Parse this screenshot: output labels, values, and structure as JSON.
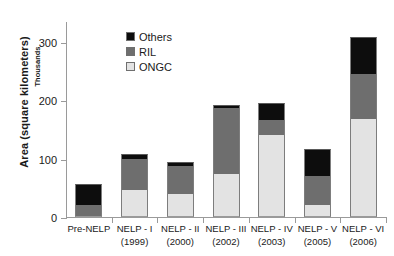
{
  "chart_data": {
    "type": "bar",
    "stacked": true,
    "title": "",
    "subtitle": "",
    "xlabel": "",
    "ylabel": "Area (square kilometers)",
    "y_secondary_label": "Thousands",
    "categories": [
      "Pre-NELP",
      "NELP - I",
      "NELP - II",
      "NELP - III",
      "NELP - IV",
      "NELP - V",
      "NELP - VI"
    ],
    "category_sublabels": [
      "",
      "(1999)",
      "(2000)",
      "(2002)",
      "(2003)",
      "(2005)",
      "(2006)"
    ],
    "series": [
      {
        "name": "ONGC",
        "color": "#e3e3e3",
        "values": [
          0,
          47,
          39,
          74,
          140,
          21,
          168
        ]
      },
      {
        "name": "RIL",
        "color": "#6e6e6e",
        "values": [
          21,
          52,
          49,
          113,
          27,
          50,
          77
        ]
      },
      {
        "name": "Others",
        "color": "#0d0d0d",
        "values": [
          36,
          9,
          7,
          5,
          28,
          46,
          63
        ]
      }
    ],
    "stack_order_bottom_to_top": [
      "ONGC",
      "RIL",
      "Others"
    ],
    "totals": [
      57,
      108,
      95,
      192,
      195,
      117,
      308
    ],
    "ylim": [
      0,
      336
    ],
    "yticks": [
      0,
      100,
      200,
      300
    ],
    "ytick_labels": [
      "0",
      "100",
      "200",
      "300"
    ],
    "grid": false,
    "legend_position": "inside-top-left",
    "legend": [
      {
        "label": "Others",
        "color": "#0d0d0d"
      },
      {
        "label": "RIL",
        "color": "#6e6e6e"
      },
      {
        "label": "ONGC",
        "color": "#e3e3e3"
      }
    ]
  }
}
